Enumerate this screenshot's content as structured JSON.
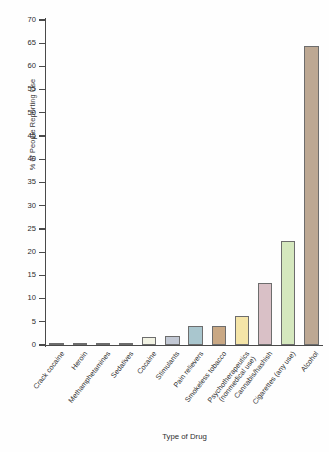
{
  "chart_data": {
    "type": "bar",
    "title": "",
    "xlabel": "Type of Drug",
    "ylabel": "% of People Reporting Use",
    "ylim": [
      0,
      70
    ],
    "ytick_step": 5,
    "yticks": [
      0,
      5,
      10,
      15,
      20,
      25,
      30,
      35,
      40,
      45,
      50,
      55,
      60,
      65,
      70
    ],
    "grid": false,
    "legend": "none",
    "categories": [
      "Crack cocaine",
      "Heroin",
      "Methamphetamines",
      "Sedatives",
      "Cocaine",
      "Stimulants",
      "Pain relievers",
      "Smokeless tobacco",
      "Psychotherapeutics\n(nonmedical use)",
      "Cannabis/hashish",
      "Cigarettes (any use)",
      "Alcohol"
    ],
    "values": [
      0.3,
      0.3,
      0.3,
      0.4,
      1.7,
      1.9,
      4.2,
      4.2,
      6.3,
      13.4,
      22.3,
      64.5
    ],
    "bar_colors": [
      "#b0ada0",
      "#b2afa2",
      "#b2afa2",
      "#b6b3a6",
      "#f2f3e4",
      "#c2c8d4",
      "#a9c6ce",
      "#c9a884",
      "#f5e5a8",
      "#d9c0c6",
      "#d5e8be",
      "#bda893"
    ],
    "bar_edge_color": "#6d6d6d",
    "axis_color": "#4a4a4a"
  },
  "axis": {
    "ylabel": "% of People Reporting Use",
    "xlabel": "Type of Drug"
  }
}
